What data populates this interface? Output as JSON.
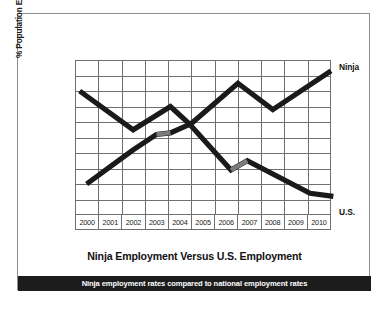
{
  "chart_data": {
    "type": "line",
    "title": "Ninja Employment Versus U.S. Employment",
    "caption": "Ninja employment rates compared to national employment rates",
    "xlabel": "",
    "ylabel": "% Population Employed",
    "categories": [
      "2000",
      "2001",
      "2002",
      "2003",
      "2004",
      "2005",
      "2006",
      "2007",
      "2008",
      "2009",
      "2010"
    ],
    "xlim": [
      2000,
      2010
    ],
    "ylim": [
      0,
      10
    ],
    "grid": true,
    "grid_rows": 10,
    "grid_cols": 11,
    "y_ticks_labeled": false,
    "legend_position": "right-of-plot (inline end labels)",
    "series": [
      {
        "name": "Ninja",
        "color": "#1a1a1a",
        "label_position": "upper-right",
        "points": [
          {
            "x": 2000.0,
            "y": 2.0
          },
          {
            "x": 2001.0,
            "y": 3.1
          },
          {
            "x": 2002.0,
            "y": 4.2
          },
          {
            "x": 2003.0,
            "y": 5.2
          },
          {
            "x": 2003.6,
            "y": 5.3
          },
          {
            "x": 2004.5,
            "y": 5.9
          },
          {
            "x": 2006.5,
            "y": 8.5
          },
          {
            "x": 2008.0,
            "y": 6.8
          },
          {
            "x": 2010.5,
            "y": 9.3
          }
        ],
        "highlight_segments": [
          {
            "from_x": 2003.0,
            "to_x": 2003.6,
            "color": "#7b7b7b"
          }
        ]
      },
      {
        "name": "U.S.",
        "color": "#1a1a1a",
        "label_position": "lower-right",
        "points": [
          {
            "x": 1999.7,
            "y": 8.0
          },
          {
            "x": 2002.0,
            "y": 5.5
          },
          {
            "x": 2003.6,
            "y": 7.0
          },
          {
            "x": 2004.4,
            "y": 5.9
          },
          {
            "x": 2006.2,
            "y": 2.9
          },
          {
            "x": 2006.9,
            "y": 3.5
          },
          {
            "x": 2009.6,
            "y": 1.4
          },
          {
            "x": 2010.6,
            "y": 1.2
          }
        ],
        "highlight_segments": [
          {
            "from_x": 2006.2,
            "to_x": 2006.9,
            "color": "#7b7b7b"
          }
        ]
      }
    ]
  },
  "labels": {
    "ninja": "Ninja",
    "us": "U.S."
  },
  "colors": {
    "line": "#1a1a1a",
    "highlight": "#7b7b7b",
    "grid": "#6f6f6f",
    "frame": "#8e8e8e",
    "footer_bg": "#1c1c1c",
    "footer_text": "#ffffff",
    "text": "#111111",
    "background": "#ffffff"
  }
}
